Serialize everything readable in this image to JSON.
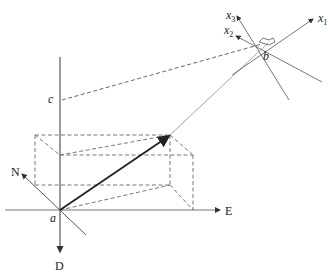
{
  "diagram": {
    "labels": {
      "origin": "a",
      "point_b": "b",
      "point_c": "c",
      "north": "N",
      "east": "E",
      "down": "D",
      "x1": "x",
      "x1_sub": "1",
      "x2": "x",
      "x2_sub": "2",
      "x3": "x",
      "x3_sub": "3"
    },
    "colors": {
      "line": "#555555",
      "vector": "#222222",
      "dashed": "#666666"
    }
  }
}
